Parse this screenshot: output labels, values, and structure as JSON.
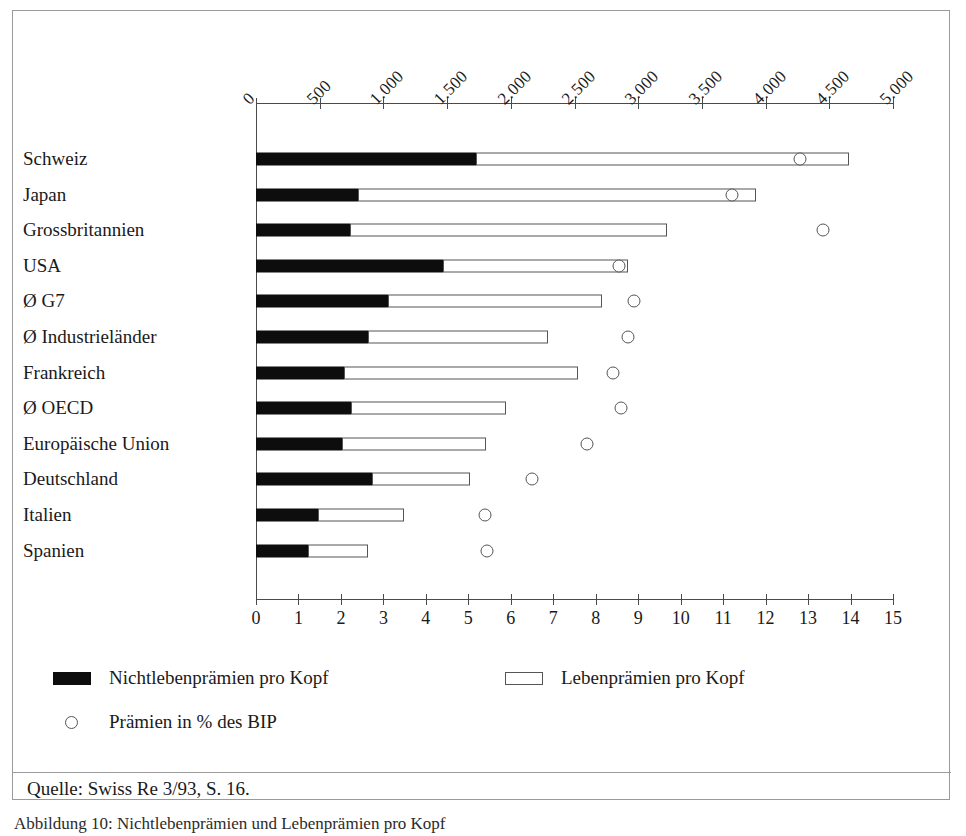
{
  "figure": {
    "caption": "Abbildung 10:   Nichtlebenprämien und Lebenprämien pro Kopf",
    "source": "Quelle: Swiss Re 3/93, S. 16."
  },
  "legend": {
    "nonlife_label": "Nichtlebenprämien pro Kopf",
    "life_label": "Lebenprämien pro Kopf",
    "pct_label": "Prämien in % des BIP",
    "nonlife_icon": "filled-bar-swatch-icon",
    "life_icon": "outlined-bar-swatch-icon",
    "pct_icon": "open-circle-marker-icon"
  },
  "axes": {
    "top": {
      "labels": [
        "0",
        "500",
        "1.000",
        "1.500",
        "2.000",
        "2.500",
        "3.000",
        "3.500",
        "4.000",
        "4.500",
        "5.000"
      ],
      "values": [
        0,
        500,
        1000,
        1500,
        2000,
        2500,
        3000,
        3500,
        4000,
        4500,
        5000
      ],
      "min": 0,
      "max": 5000
    },
    "bottom": {
      "labels": [
        "0",
        "1",
        "2",
        "3",
        "4",
        "5",
        "6",
        "7",
        "8",
        "9",
        "10",
        "11",
        "12",
        "13",
        "14",
        "15"
      ],
      "values": [
        0,
        1,
        2,
        3,
        4,
        5,
        6,
        7,
        8,
        9,
        10,
        11,
        12,
        13,
        14,
        15
      ],
      "min": 0,
      "max": 15
    }
  },
  "chart_data": {
    "type": "bar",
    "orientation": "horizontal",
    "title": "Nichtlebenprämien und Lebenprämien pro Kopf",
    "subtitle": "",
    "xlabel": "",
    "ylabel": "",
    "grid": false,
    "legend_position": "bottom",
    "stacked": true,
    "categories": [
      "Schweiz",
      "Japan",
      "Grossbritannien",
      "USA",
      "Ø G7",
      "Ø Industrieländer",
      "Frankreich",
      "Ø OECD",
      "Europäische Union",
      "Deutschland",
      "Italien",
      "Spanien"
    ],
    "series": [
      {
        "name": "Nichtlebenprämien pro Kopf",
        "axis": "top",
        "unit": "USD pro Kopf",
        "values": [
          1730,
          800,
          740,
          1470,
          1040,
          880,
          690,
          745,
          675,
          910,
          485,
          410
        ]
      },
      {
        "name": "Lebenprämien pro Kopf",
        "axis": "top",
        "unit": "USD pro Kopf",
        "values": [
          2925,
          3125,
          2490,
          1450,
          1675,
          1410,
          1840,
          1215,
          1130,
          770,
          675,
          470
        ]
      },
      {
        "name": "Prämien in % des BIP",
        "axis": "bottom",
        "unit": "%",
        "marker": "open-circle",
        "values": [
          12.8,
          11.2,
          13.35,
          8.55,
          8.9,
          8.75,
          8.4,
          8.6,
          7.8,
          6.5,
          5.4,
          5.45
        ]
      }
    ],
    "totals_top_axis": [
      4655,
      3925,
      3230,
      2920,
      2715,
      2290,
      2530,
      1960,
      1805,
      1680,
      1160,
      880
    ],
    "top_axis_range": [
      0,
      5000
    ],
    "bottom_axis_range": [
      0,
      15
    ]
  }
}
